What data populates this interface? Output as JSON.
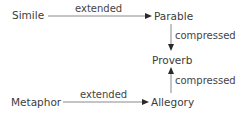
{
  "diagram": {
    "nodes": {
      "simile": "Simile",
      "parable": "Parable",
      "proverb": "Proverb",
      "metaphor": "Metaphor",
      "allegory": "Allegory"
    },
    "edges": [
      {
        "from": "Simile",
        "to": "Parable",
        "label": "extended"
      },
      {
        "from": "Parable",
        "to": "Proverb",
        "label": "compressed"
      },
      {
        "from": "Allegory",
        "to": "Proverb",
        "label": "compressed"
      },
      {
        "from": "Metaphor",
        "to": "Allegory",
        "label": "extended"
      }
    ],
    "colors": {
      "text": "#3c3c3c",
      "line": "#8a8a8a",
      "arrowhead": "#2a2a2a"
    }
  }
}
